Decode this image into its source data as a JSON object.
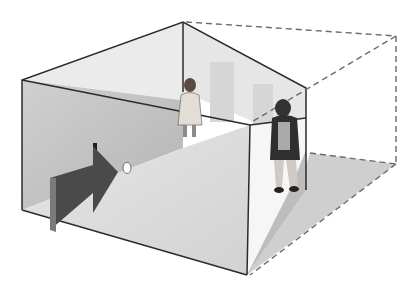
{
  "figure": {
    "colors": {
      "background": "#ffffff",
      "outline": "#2b2b2b",
      "dashed": "#6a6a6a",
      "left_wall": "#bdbdbd",
      "back_wall": "#e4e4e4",
      "ceiling": "#ececec",
      "floor": "#d9d9d9",
      "right_wall": "#f4f4f4",
      "shadow": "#c8c8c8",
      "arrow": "#4a4a4a",
      "arrow_edge": "#7a7a7a"
    },
    "elements": {
      "room": "distorted room",
      "apparent_room": "dashed apparent room outline",
      "viewer_arrow": "viewing direction arrow",
      "peephole": "peephole",
      "person_near": "person near corner (appears large)",
      "person_far": "person far corner (appears small)"
    }
  }
}
